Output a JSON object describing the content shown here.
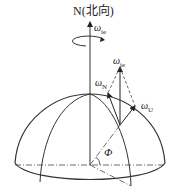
{
  "diagram": {
    "north_label": "N(北向)",
    "omega_symbol": "ω",
    "labels": {
      "omega_ie_top": {
        "symbol": "ω",
        "sub": "ie"
      },
      "omega_ie_vec": {
        "symbol": "ω",
        "sub": "ie"
      },
      "omega_N": {
        "symbol": "ω",
        "sub": "N"
      },
      "omega_U": {
        "symbol": "ω",
        "sub": "U"
      },
      "latitude": "Φ"
    },
    "colors": {
      "stroke": "#333333",
      "background": "#ffffff"
    }
  }
}
